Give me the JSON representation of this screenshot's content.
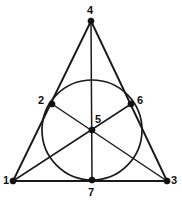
{
  "figure": {
    "background_color": "#ffffff",
    "stroke_color": "#1a1a1a",
    "label_color": "#111111",
    "width": 182,
    "height": 203
  },
  "chart_data": {
    "type": "diagram",
    "xlabel": "",
    "ylabel": "",
    "grid": false,
    "legend": "none",
    "xlim": [
      0,
      182
    ],
    "ylim": [
      0,
      203
    ],
    "points": [
      {
        "id": "1",
        "label": "1",
        "x": 13,
        "y": 181,
        "role": "triangle-vertex-bottom-left",
        "label_x": 3,
        "label_y": 175
      },
      {
        "id": "2",
        "label": "2",
        "x": 52,
        "y": 104,
        "role": "incircle-tangent-left-side",
        "label_x": 38,
        "label_y": 95
      },
      {
        "id": "3",
        "label": "3",
        "x": 167,
        "y": 181,
        "role": "triangle-vertex-bottom-right",
        "label_x": 171,
        "label_y": 175
      },
      {
        "id": "4",
        "label": "4",
        "x": 91,
        "y": 21,
        "role": "triangle-vertex-apex",
        "label_x": 87,
        "label_y": 5
      },
      {
        "id": "5",
        "label": "5",
        "x": 92,
        "y": 130,
        "role": "incircle-center",
        "label_x": 95,
        "label_y": 114
      },
      {
        "id": "6",
        "label": "6",
        "x": 131,
        "y": 104,
        "role": "incircle-tangent-right-side",
        "label_x": 137,
        "label_y": 95
      },
      {
        "id": "7",
        "label": "7",
        "x": 92,
        "y": 180,
        "role": "incircle-tangent-base",
        "label_x": 88,
        "label_y": 187
      }
    ],
    "circle": {
      "label": "incircle",
      "center_x": 92,
      "center_y": 130,
      "radius": 50
    },
    "triangle_edges": [
      {
        "label": "1-4",
        "from": "1",
        "to": "4"
      },
      {
        "label": "4-3",
        "from": "4",
        "to": "3"
      },
      {
        "label": "1-3",
        "from": "1",
        "to": "3"
      }
    ],
    "cevians": [
      {
        "label": "4-5-7",
        "from": "4",
        "through": "5",
        "to": "7"
      },
      {
        "label": "1-5-6",
        "from": "1",
        "through": "5",
        "to": "6"
      },
      {
        "label": "3-5-2",
        "from": "3",
        "through": "5",
        "to": "2"
      }
    ]
  }
}
